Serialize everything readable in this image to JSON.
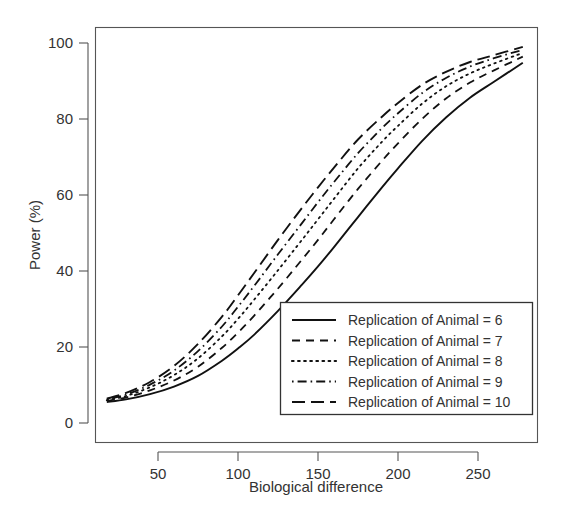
{
  "chart_data": {
    "type": "line",
    "title": "",
    "subtitle": "",
    "xlabel": "Biological difference",
    "ylabel": "Power (%)",
    "xlim": [
      15,
      280
    ],
    "ylim": [
      0,
      100
    ],
    "xticks": [
      50,
      100,
      150,
      200,
      250
    ],
    "xticklabels": [
      "50",
      "100",
      "150",
      "200",
      "250"
    ],
    "yticks": [
      0,
      20,
      40,
      60,
      80,
      100
    ],
    "yticklabels": [
      "0",
      "20",
      "40",
      "60",
      "80",
      "100"
    ],
    "grid": false,
    "legend_position": "bottom-right",
    "legend_entries": [
      {
        "label": "Replication of  Animal =  6",
        "linestyle": "solid",
        "dash": "none"
      },
      {
        "label": "Replication of  Animal =  7",
        "linestyle": "dashed",
        "dash": "8,6"
      },
      {
        "label": "Replication of  Animal =  8",
        "linestyle": "dotted",
        "dash": "1.6,4.5"
      },
      {
        "label": "Replication of  Animal =  9",
        "linestyle": "dashdot",
        "dash": "1.6,4,9,4"
      },
      {
        "label": "Replication of  Animal =  10",
        "linestyle": "longdash",
        "dash": "13,6"
      }
    ],
    "x": [
      18,
      30,
      45,
      60,
      75,
      90,
      100,
      110,
      125,
      140,
      150,
      160,
      175,
      190,
      200,
      215,
      230,
      245,
      260,
      278
    ],
    "series": [
      {
        "name": "Replication of  Animal =  6",
        "linestyle": "solid",
        "dash": "none",
        "values": [
          5.5,
          6.2,
          7.6,
          9.6,
          12.4,
          16.4,
          19.6,
          23.2,
          29.5,
          36.4,
          41.2,
          46.3,
          54.2,
          62.0,
          67.0,
          74.2,
          80.4,
          85.6,
          89.8,
          94.8
        ]
      },
      {
        "name": "Replication of  Animal =  7",
        "linestyle": "dashed",
        "dash": "8,6",
        "values": [
          5.8,
          6.7,
          8.6,
          11.2,
          14.8,
          19.8,
          23.8,
          28.2,
          35.4,
          43.0,
          48.2,
          53.6,
          61.6,
          69.0,
          73.6,
          80.0,
          85.4,
          89.6,
          92.8,
          96.4
        ]
      },
      {
        "name": "Replication of  Animal =  8",
        "linestyle": "dotted",
        "dash": "1.6,4.5",
        "values": [
          6.0,
          7.1,
          9.4,
          12.6,
          17.0,
          22.8,
          27.4,
          32.4,
          40.2,
          48.2,
          53.6,
          59.0,
          67.0,
          74.0,
          78.2,
          84.0,
          88.6,
          92.0,
          94.6,
          97.4
        ]
      },
      {
        "name": "Replication of  Animal =  9",
        "linestyle": "dashdot",
        "dash": "1.6,4,9,4",
        "values": [
          6.2,
          7.5,
          10.1,
          13.8,
          18.9,
          25.4,
          30.6,
          36.0,
          44.4,
          52.6,
          58.1,
          63.4,
          71.0,
          77.6,
          81.5,
          86.8,
          90.8,
          93.8,
          96.0,
          98.2
        ]
      },
      {
        "name": "Replication of  Animal =  10",
        "linestyle": "longdash",
        "dash": "13,6",
        "values": [
          6.4,
          7.9,
          10.8,
          15.0,
          20.8,
          28.0,
          33.6,
          39.4,
          48.2,
          56.6,
          62.0,
          67.2,
          74.6,
          80.6,
          84.2,
          89.0,
          92.4,
          95.0,
          96.8,
          99.0
        ]
      }
    ]
  }
}
